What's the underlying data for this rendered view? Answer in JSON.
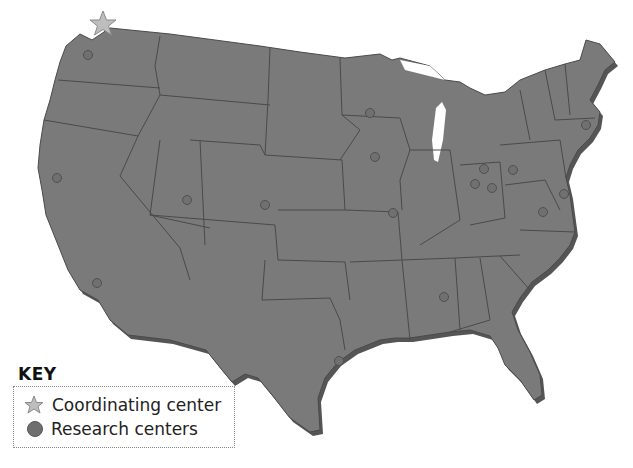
{
  "map": {
    "title": "Map of United States with research centers",
    "colors": {
      "land": "#7a7a7a",
      "border": "#4a4a4a",
      "shadow": "#555555",
      "marker": "#707070",
      "star": "#bdbdbd",
      "background": "#ffffff"
    },
    "coordinating_center": {
      "label": "Seattle, WA",
      "x": 103,
      "y": 24
    },
    "research_centers": [
      {
        "x": 88,
        "y": 55
      },
      {
        "x": 57,
        "y": 178
      },
      {
        "x": 97,
        "y": 283
      },
      {
        "x": 187,
        "y": 200
      },
      {
        "x": 265,
        "y": 205
      },
      {
        "x": 370,
        "y": 113
      },
      {
        "x": 375,
        "y": 157
      },
      {
        "x": 393,
        "y": 213
      },
      {
        "x": 484,
        "y": 169
      },
      {
        "x": 475,
        "y": 184
      },
      {
        "x": 492,
        "y": 188
      },
      {
        "x": 513,
        "y": 170
      },
      {
        "x": 586,
        "y": 125
      },
      {
        "x": 564,
        "y": 194
      },
      {
        "x": 543,
        "y": 212
      },
      {
        "x": 444,
        "y": 297
      },
      {
        "x": 339,
        "y": 361
      }
    ]
  },
  "key": {
    "title": "KEY",
    "items": [
      {
        "icon": "star-icon",
        "label": "Coordinating center"
      },
      {
        "icon": "dot-icon",
        "label": "Research centers"
      }
    ]
  }
}
